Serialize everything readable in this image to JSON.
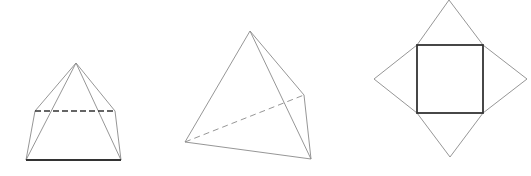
{
  "figures": [
    {
      "name": "square-pyramid-3d",
      "description": "Square pyramid in perspective with hidden back edge dashed",
      "vertices": {
        "apex": [
          76,
          63
        ],
        "back_left": [
          35,
          111
        ],
        "back_right": [
          115,
          111
        ],
        "front_left": [
          26,
          160
        ],
        "front_right": [
          121,
          160
        ]
      },
      "edges": {
        "solid_thin": [
          [
            "apex",
            "back_left"
          ],
          [
            "apex",
            "back_right"
          ],
          [
            "apex",
            "front_left"
          ],
          [
            "apex",
            "front_right"
          ],
          [
            "back_left",
            "front_left"
          ],
          [
            "back_right",
            "front_right"
          ]
        ],
        "solid_bold": [
          [
            "front_left",
            "front_right"
          ]
        ],
        "dashed_bold": [
          [
            "back_left",
            "back_right"
          ]
        ]
      }
    },
    {
      "name": "tetrahedron-3d",
      "description": "Triangular pyramid with hidden base edge dashed",
      "vertices": {
        "apex": [
          250,
          31
        ],
        "left": [
          185,
          142
        ],
        "back_right": [
          304,
          95
        ],
        "front_right": [
          311,
          159
        ]
      },
      "edges": {
        "solid_thin": [
          [
            "apex",
            "left"
          ],
          [
            "apex",
            "back_right"
          ],
          [
            "apex",
            "front_right"
          ],
          [
            "left",
            "front_right"
          ],
          [
            "back_right",
            "front_right"
          ]
        ],
        "dashed_thin": [
          [
            "left",
            "back_right"
          ]
        ]
      }
    },
    {
      "name": "square-pyramid-net",
      "description": "Net of a square pyramid: square base with four triangular faces",
      "square": {
        "x": 417,
        "y": 45,
        "width": 66,
        "height": 68
      },
      "triangle_tips": {
        "top": [
          449,
          0
        ],
        "left": [
          374,
          79
        ],
        "right": [
          527,
          79
        ],
        "bottom": [
          450,
          157
        ]
      }
    }
  ],
  "colors": {
    "thin_line": "#8a8a8a",
    "bold_line": "#333333",
    "background": "#ffffff"
  }
}
